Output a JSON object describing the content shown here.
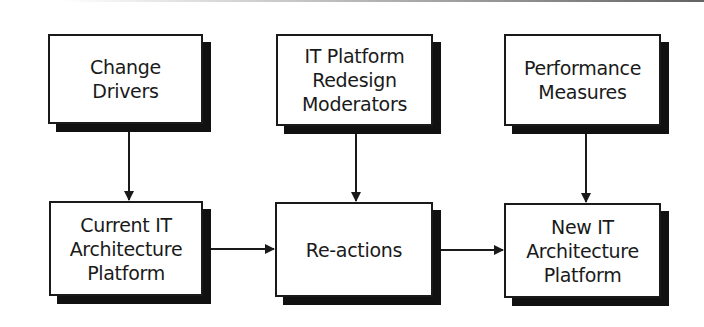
{
  "diagram": {
    "type": "flowchart",
    "nodes": [
      {
        "id": "change_drivers",
        "label": "Change\nDrivers",
        "row": 1,
        "col": 1
      },
      {
        "id": "it_platform_redesign_moderators",
        "label": "IT Platform\nRedesign\nModerators",
        "row": 1,
        "col": 2
      },
      {
        "id": "performance_measures",
        "label": "Performance\nMeasures",
        "row": 1,
        "col": 3
      },
      {
        "id": "current_it_architecture_platform",
        "label": "Current IT\nArchitecture\nPlatform",
        "row": 2,
        "col": 1
      },
      {
        "id": "re_actions",
        "label": "Re-actions",
        "row": 2,
        "col": 2
      },
      {
        "id": "new_it_architecture_platform",
        "label": "New IT\nArchitecture\nPlatform",
        "row": 2,
        "col": 3
      }
    ],
    "edges": [
      {
        "from": "change_drivers",
        "to": "current_it_architecture_platform"
      },
      {
        "from": "it_platform_redesign_moderators",
        "to": "re_actions"
      },
      {
        "from": "performance_measures",
        "to": "new_it_architecture_platform"
      },
      {
        "from": "current_it_architecture_platform",
        "to": "re_actions"
      },
      {
        "from": "re_actions",
        "to": "new_it_architecture_platform"
      }
    ],
    "colors": {
      "border": "#1a1a1a",
      "shadow": "#111111",
      "fill": "#ffffff",
      "text": "#1a1a1a"
    }
  }
}
